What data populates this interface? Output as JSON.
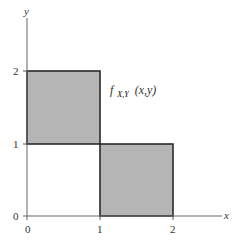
{
  "diagram": {
    "type": "joint-density-support",
    "axes": {
      "x_label": "x",
      "y_label": "y",
      "x_ticks": [
        "0",
        "1",
        "2"
      ],
      "y_ticks": [
        "0",
        "1",
        "2"
      ]
    },
    "function_label": {
      "main": "f",
      "subscript": "X,Y",
      "args": "(x,y)"
    },
    "regions": [
      {
        "name": "upper-left-square",
        "x_range": [
          0,
          1
        ],
        "y_range": [
          1,
          2
        ]
      },
      {
        "name": "lower-right-square",
        "x_range": [
          1,
          2
        ],
        "y_range": [
          0,
          1
        ]
      }
    ],
    "colors": {
      "fill": "#b5b5b5",
      "stroke": "#2a2a2a",
      "axis": "#555555",
      "background": "#ffffff"
    }
  }
}
